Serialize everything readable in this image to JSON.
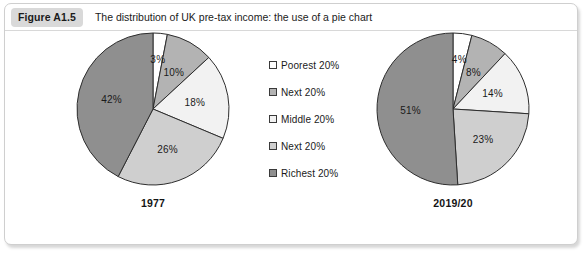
{
  "figure": {
    "badge": "Figure A1.5",
    "title": "The distribution of UK pre-tax income: the use of a pie chart"
  },
  "legend": {
    "position": "center",
    "items": [
      {
        "label": "Poorest 20%",
        "color": "#ffffff",
        "swatch_icon": "square-swatch-icon"
      },
      {
        "label": "Next 20%",
        "color": "#b3b3b3",
        "swatch_icon": "square-swatch-icon"
      },
      {
        "label": "Middle 20%",
        "color": "#f2f2f2",
        "swatch_icon": "square-swatch-icon"
      },
      {
        "label": "Next 20%",
        "color": "#cfcfcf",
        "swatch_icon": "square-swatch-icon"
      },
      {
        "label": "Richest 20%",
        "color": "#8f8f8f",
        "swatch_icon": "square-swatch-icon"
      }
    ]
  },
  "charts": [
    {
      "id": "pie-1977",
      "caption": "1977",
      "labels": [
        "3%",
        "10%",
        "18%",
        "26%",
        "42%"
      ]
    },
    {
      "id": "pie-201920",
      "caption": "2019/20",
      "labels": [
        "4%",
        "8%",
        "14%",
        "23%",
        "51%"
      ]
    }
  ],
  "chart_data": [
    {
      "type": "pie",
      "title": "1977",
      "categories": [
        "Poorest 20%",
        "Next 20%",
        "Middle 20%",
        "Next 20%",
        "Richest 20%"
      ],
      "values": [
        3,
        10,
        18,
        26,
        42
      ],
      "unit": "%",
      "data_labels": [
        "3%",
        "10%",
        "18%",
        "26%",
        "42%"
      ],
      "colors": [
        "#ffffff",
        "#b3b3b3",
        "#f2f2f2",
        "#cfcfcf",
        "#8f8f8f"
      ],
      "start_angle_deg": 0,
      "direction": "clockwise",
      "legend": "shared",
      "grid": false
    },
    {
      "type": "pie",
      "title": "2019/20",
      "categories": [
        "Poorest 20%",
        "Next 20%",
        "Middle 20%",
        "Next 20%",
        "Richest 20%"
      ],
      "values": [
        4,
        8,
        14,
        23,
        51
      ],
      "unit": "%",
      "data_labels": [
        "4%",
        "8%",
        "14%",
        "23%",
        "51%"
      ],
      "colors": [
        "#ffffff",
        "#b3b3b3",
        "#f2f2f2",
        "#cfcfcf",
        "#8f8f8f"
      ],
      "start_angle_deg": 0,
      "direction": "clockwise",
      "legend": "shared",
      "grid": false
    }
  ]
}
